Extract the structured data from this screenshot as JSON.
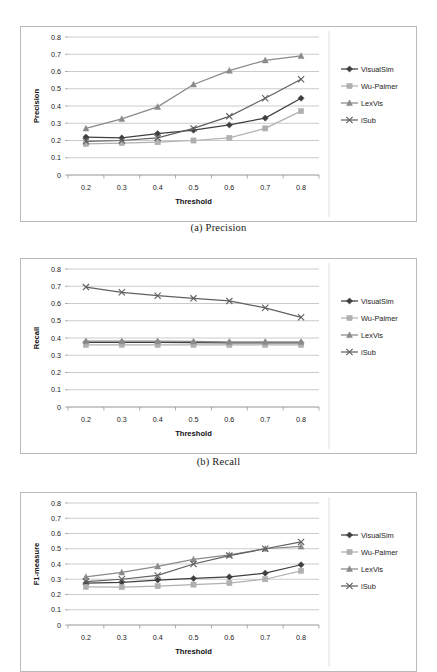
{
  "figure": {
    "captions": [
      {
        "id": "caption-a",
        "text": "(a) Precision"
      },
      {
        "id": "caption-b",
        "text": "(b) Recall"
      }
    ]
  },
  "series_names": [
    "VisualSim",
    "Wu-Palmer",
    "LexVis",
    "iSub"
  ],
  "colors": {
    "visualsim": "#3f3f3f",
    "wupalmer": "#b0b0b0",
    "lexvis": "#8a8a8a",
    "isub": "#606060",
    "gridline": "#a8a8a8",
    "axis": "#7a7a7a",
    "frame": "#b9b9b9",
    "text": "#222222"
  },
  "legend": {
    "items": [
      {
        "label": "VisualSim",
        "marker": "diamond",
        "color": "#3f3f3f"
      },
      {
        "label": "Wu-Palmer",
        "marker": "square",
        "color": "#b0b0b0"
      },
      {
        "label": "LexVis",
        "marker": "triangle",
        "color": "#8a8a8a"
      },
      {
        "label": "iSub",
        "marker": "cross",
        "color": "#606060"
      }
    ]
  },
  "chart_data": [
    {
      "type": "line",
      "id": "precision-chart",
      "title": "",
      "xlabel": "Threshold",
      "ylabel": "Precision",
      "x": [
        0.2,
        0.3,
        0.4,
        0.5,
        0.6,
        0.7,
        0.8
      ],
      "xticklabels": [
        "0.2",
        "0.3",
        "0.4",
        "0.5",
        "0.6",
        "0.7",
        "0.8"
      ],
      "yticklabels": [
        "0",
        "0.1",
        "0.2",
        "0.3",
        "0.4",
        "0.5",
        "0.6",
        "0.7",
        "0.8"
      ],
      "ylim": [
        0,
        0.8
      ],
      "xlim": [
        0.15,
        0.85
      ],
      "grid": true,
      "legend_position": "right",
      "series": [
        {
          "name": "VisualSim",
          "marker": "diamond",
          "color": "#3f3f3f",
          "values": [
            0.22,
            0.215,
            0.24,
            0.26,
            0.29,
            0.33,
            0.445
          ]
        },
        {
          "name": "Wu-Palmer",
          "marker": "square",
          "color": "#b0b0b0",
          "values": [
            0.18,
            0.185,
            0.19,
            0.2,
            0.215,
            0.27,
            0.37
          ]
        },
        {
          "name": "LexVis",
          "marker": "triangle",
          "color": "#8a8a8a",
          "values": [
            0.27,
            0.325,
            0.395,
            0.525,
            0.605,
            0.665,
            0.69
          ]
        },
        {
          "name": "iSub",
          "marker": "cross",
          "color": "#606060",
          "values": [
            0.195,
            0.2,
            0.215,
            0.27,
            0.34,
            0.445,
            0.555
          ]
        }
      ]
    },
    {
      "type": "line",
      "id": "recall-chart",
      "title": "",
      "xlabel": "Threshold",
      "ylabel": "Recall",
      "x": [
        0.2,
        0.3,
        0.4,
        0.5,
        0.6,
        0.7,
        0.8
      ],
      "xticklabels": [
        "0.2",
        "0.3",
        "0.4",
        "0.5",
        "0.6",
        "0.7",
        "0.8"
      ],
      "yticklabels": [
        "0",
        "0.1",
        "0.2",
        "0.3",
        "0.4",
        "0.5",
        "0.6",
        "0.7",
        "0.8"
      ],
      "ylim": [
        0,
        0.8
      ],
      "xlim": [
        0.15,
        0.85
      ],
      "grid": true,
      "legend_position": "right",
      "series": [
        {
          "name": "VisualSim",
          "marker": "diamond",
          "color": "#3f3f3f",
          "values": [
            0.375,
            0.375,
            0.375,
            0.373,
            0.372,
            0.372,
            0.372
          ]
        },
        {
          "name": "Wu-Palmer",
          "marker": "square",
          "color": "#b0b0b0",
          "values": [
            0.36,
            0.36,
            0.36,
            0.36,
            0.36,
            0.36,
            0.36
          ]
        },
        {
          "name": "LexVis",
          "marker": "triangle",
          "color": "#8a8a8a",
          "values": [
            0.382,
            0.382,
            0.382,
            0.38,
            0.378,
            0.378,
            0.378
          ]
        },
        {
          "name": "iSub",
          "marker": "cross",
          "color": "#606060",
          "values": [
            0.695,
            0.665,
            0.645,
            0.63,
            0.615,
            0.575,
            0.52
          ]
        }
      ]
    },
    {
      "type": "line",
      "id": "f1-chart",
      "title": "",
      "xlabel": "Threshold",
      "ylabel": "F1-measure",
      "x": [
        0.2,
        0.3,
        0.4,
        0.5,
        0.6,
        0.7,
        0.8
      ],
      "xticklabels": [
        "0.2",
        "0.3",
        "0.4",
        "0.5",
        "0.6",
        "0.7",
        "0.8"
      ],
      "yticklabels": [
        "0",
        "0.1",
        "0.2",
        "0.3",
        "0.4",
        "0.5",
        "0.6",
        "0.7",
        "0.8"
      ],
      "ylim": [
        0,
        0.8
      ],
      "xlim": [
        0.15,
        0.85
      ],
      "grid": true,
      "legend_position": "right",
      "series": [
        {
          "name": "VisualSim",
          "marker": "diamond",
          "color": "#3f3f3f",
          "values": [
            0.275,
            0.28,
            0.295,
            0.305,
            0.315,
            0.34,
            0.395
          ]
        },
        {
          "name": "Wu-Palmer",
          "marker": "square",
          "color": "#b0b0b0",
          "values": [
            0.25,
            0.248,
            0.255,
            0.265,
            0.275,
            0.3,
            0.355
          ]
        },
        {
          "name": "LexVis",
          "marker": "triangle",
          "color": "#8a8a8a",
          "values": [
            0.315,
            0.345,
            0.385,
            0.43,
            0.46,
            0.5,
            0.515
          ]
        },
        {
          "name": "iSub",
          "marker": "cross",
          "color": "#606060",
          "values": [
            0.285,
            0.3,
            0.325,
            0.4,
            0.455,
            0.5,
            0.545
          ]
        }
      ]
    }
  ]
}
